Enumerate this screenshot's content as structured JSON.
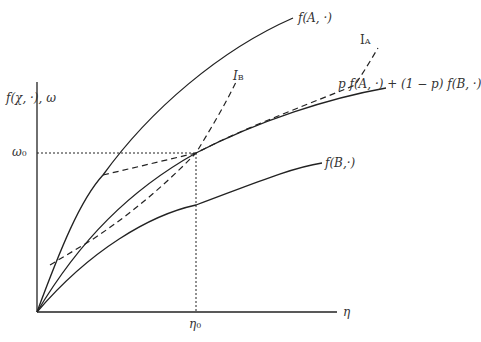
{
  "diagram": {
    "axes": {
      "y_label": "f(χ, ·),  ω",
      "x_label": "η",
      "omega0_label": "ω",
      "omega0_sub": "0",
      "eta0_label": "η",
      "eta0_sub": "0"
    },
    "curves": {
      "fA_label": "f(A, ·)",
      "fB_label": "f(B,·)",
      "mix_label": "p f(A, ·) + (1 − p) f(B, ·)",
      "IA_label": "I",
      "IA_sub": "A",
      "IB_label": "I",
      "IB_sub": "B"
    },
    "colors": {
      "line": "#222222",
      "text": "#333333"
    }
  }
}
